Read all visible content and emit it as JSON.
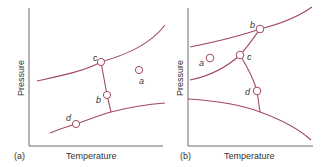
{
  "figure": {
    "panels": [
      {
        "id": "a",
        "panel_label": "(a)",
        "x_axis_label": "Temperature",
        "y_axis_label": "Pressure",
        "points": [
          {
            "name": "a",
            "label": "a"
          },
          {
            "name": "b",
            "label": "b"
          },
          {
            "name": "c",
            "label": "c"
          },
          {
            "name": "d",
            "label": "d"
          }
        ]
      },
      {
        "id": "b",
        "panel_label": "(b)",
        "x_axis_label": "Temperature",
        "y_axis_label": "Pressure",
        "points": [
          {
            "name": "a",
            "label": "a"
          },
          {
            "name": "b",
            "label": "b"
          },
          {
            "name": "c",
            "label": "c"
          },
          {
            "name": "d",
            "label": "d"
          }
        ]
      }
    ],
    "colors": {
      "curve": "#a3485f",
      "axis": "#6b6b6b",
      "text": "#333333"
    }
  }
}
